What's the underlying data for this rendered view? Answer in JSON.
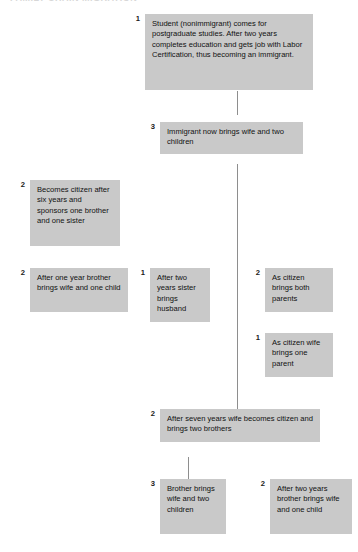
{
  "diagram": {
    "title_sliver": "FAMILY CHAIN MIGRATION",
    "box_color": "#c9c9c9",
    "line_color": "#8e8e8e",
    "nodes": [
      {
        "id": "student",
        "number": "1",
        "text": "Student (nonimmigrant) comes for postgraduate studies. After two years completes education and gets job with Labor Certification, thus becoming an immigrant."
      },
      {
        "id": "immigrant-brings-family",
        "number": "3",
        "text": "Immigrant now brings wife and two children"
      },
      {
        "id": "becomes-citizen",
        "number": "2",
        "text": "Becomes citizen after six years and sponsors one brother and one sister"
      },
      {
        "id": "brother-brings-wife-child",
        "number": "2",
        "text": "After one year brother brings wife and one child"
      },
      {
        "id": "sister-brings-husband",
        "number": "1",
        "text": "After two years sister brings husband"
      },
      {
        "id": "citizen-brings-parents",
        "number": "2",
        "text": "As citizen brings both parents"
      },
      {
        "id": "wife-brings-parent",
        "number": "1",
        "text": "As citizen wife brings one parent"
      },
      {
        "id": "wife-becomes-citizen",
        "number": "2",
        "text": "After seven years wife becomes citizen and brings two brothers"
      },
      {
        "id": "brother-brings-wife-two-children",
        "number": "3",
        "text": "Brother brings wife and two children"
      },
      {
        "id": "brother-brings-wife-one-child",
        "number": "2",
        "text": "After two years brother brings wife and one child"
      }
    ]
  }
}
